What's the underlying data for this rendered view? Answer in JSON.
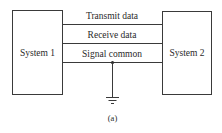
{
  "diagram": {
    "system1": {
      "label": "System 1"
    },
    "system2": {
      "label": "System 2"
    },
    "lines": [
      {
        "label": "Transmit data"
      },
      {
        "label": "Receive data"
      },
      {
        "label": "Signal common"
      }
    ],
    "ground": {
      "symbol": "ground-icon"
    },
    "caption": "(a)",
    "colors": {
      "stroke": "#3a3a3a",
      "text": "#2a2a2a",
      "background": "#ffffff"
    }
  }
}
